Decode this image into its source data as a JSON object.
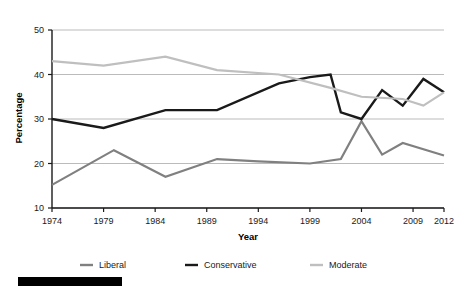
{
  "chart_data": {
    "type": "line",
    "title": "",
    "xlabel": "Year",
    "ylabel": "Percentage",
    "xlim": [
      1974,
      2012
    ],
    "ylim": [
      10,
      50
    ],
    "xticks": [
      "1974",
      "1979",
      "1984",
      "1989",
      "1994",
      "1999",
      "2004",
      "2009",
      "2012"
    ],
    "xtick_values": [
      1974,
      1979,
      1984,
      1989,
      1994,
      1999,
      2004,
      2009,
      2012
    ],
    "yticks": [
      "10",
      "20",
      "30",
      "40",
      "50"
    ],
    "ytick_values": [
      10,
      20,
      30,
      40,
      50
    ],
    "grid": "horizontal",
    "legend_position": "bottom",
    "series": [
      {
        "name": "Liberal",
        "color": "#808080",
        "width": 2.2,
        "x": [
          1974,
          1980,
          1985,
          1990,
          1994,
          1999,
          2002,
          2004,
          2006,
          2008,
          2012
        ],
        "values": [
          15.2,
          23.0,
          17.0,
          21.0,
          20.5,
          20.0,
          21.0,
          29.5,
          22.0,
          24.6,
          21.8
        ]
      },
      {
        "name": "Conservative",
        "color": "#1a1a1a",
        "width": 2.4,
        "x": [
          1974,
          1979,
          1985,
          1990,
          1996,
          1999,
          2001,
          2002,
          2004,
          2006,
          2008,
          2010,
          2012
        ],
        "values": [
          30.0,
          28.0,
          32.0,
          32.0,
          38.0,
          39.4,
          40.0,
          31.5,
          30.0,
          36.5,
          33.0,
          39.0,
          36.0
        ]
      },
      {
        "name": "Moderate",
        "color": "#bfbfbf",
        "width": 2.2,
        "x": [
          1974,
          1979,
          1985,
          1990,
          1996,
          2001,
          2004,
          2008,
          2010,
          2012
        ],
        "values": [
          43.0,
          42.0,
          44.0,
          41.0,
          40.0,
          37.0,
          35.0,
          34.5,
          33.0,
          36.0
        ]
      }
    ]
  },
  "axes": {
    "ylabel": "Percentage",
    "xlabel": "Year"
  },
  "legend": {
    "items": [
      {
        "label": "Liberal",
        "color": "#808080"
      },
      {
        "label": "Conservative",
        "color": "#1a1a1a"
      },
      {
        "label": "Moderate",
        "color": "#bfbfbf"
      }
    ]
  },
  "artifacts": {
    "redaction_bar_color": "#000000"
  }
}
